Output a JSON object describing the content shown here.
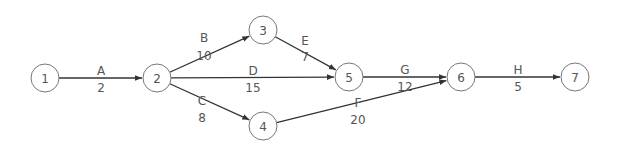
{
  "diagram": {
    "type": "activity-on-arrow network",
    "colors": {
      "line": "#333333",
      "node_border": "#777777",
      "text": "#555555",
      "background": "#ffffff"
    },
    "nodes": [
      {
        "id": "1",
        "label": "1",
        "x": 45,
        "y": 78
      },
      {
        "id": "2",
        "label": "2",
        "x": 157,
        "y": 78
      },
      {
        "id": "3",
        "label": "3",
        "x": 263,
        "y": 30
      },
      {
        "id": "4",
        "label": "4",
        "x": 263,
        "y": 126
      },
      {
        "id": "5",
        "label": "5",
        "x": 349,
        "y": 77
      },
      {
        "id": "6",
        "label": "6",
        "x": 461,
        "y": 77
      },
      {
        "id": "7",
        "label": "7",
        "x": 575,
        "y": 77
      }
    ],
    "edges": [
      {
        "from": "1",
        "to": "2",
        "activity": "A",
        "duration": "2",
        "label_x": 101,
        "activity_y": 71,
        "duration_y": 88
      },
      {
        "from": "2",
        "to": "3",
        "activity": "B",
        "duration": "10",
        "label_x": 204,
        "activity_y": 38,
        "duration_y": 56
      },
      {
        "from": "2",
        "to": "4",
        "activity": "C",
        "duration": "8",
        "label_x": 202,
        "activity_y": 101,
        "duration_y": 118
      },
      {
        "from": "2",
        "to": "5",
        "activity": "D",
        "duration": "15",
        "label_x": 253,
        "activity_y": 71,
        "duration_y": 88
      },
      {
        "from": "3",
        "to": "5",
        "activity": "E",
        "duration": "7",
        "label_x": 305,
        "activity_y": 41,
        "duration_y": 57
      },
      {
        "from": "4",
        "to": "6",
        "activity": "F",
        "duration": "20",
        "label_x": 358,
        "activity_y": 103,
        "duration_y": 120
      },
      {
        "from": "5",
        "to": "6",
        "activity": "G",
        "duration": "12",
        "label_x": 405,
        "activity_y": 70,
        "duration_y": 87
      },
      {
        "from": "6",
        "to": "7",
        "activity": "H",
        "duration": "5",
        "label_x": 518,
        "activity_y": 70,
        "duration_y": 87
      }
    ],
    "node_radius": 14
  }
}
